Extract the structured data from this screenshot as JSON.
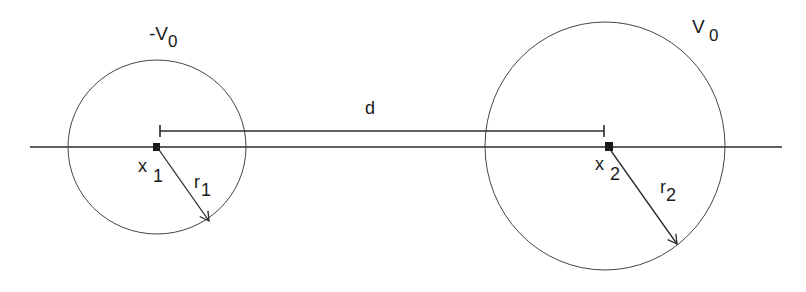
{
  "diagram": {
    "type": "two-charged-spheres",
    "colors": {
      "stroke": "#2a2a2a",
      "background": "#ffffff",
      "text": "#1a1a1a"
    },
    "sphere_left": {
      "potential_label": {
        "main": "-V",
        "sub": "0"
      },
      "center_label": {
        "main": "x",
        "sub": "1"
      },
      "radius_label": {
        "main": "r",
        "sub": "1"
      }
    },
    "sphere_right": {
      "potential_label": {
        "main": "V",
        "sub": "0"
      },
      "center_label": {
        "main": "x",
        "sub": "2"
      },
      "radius_label": {
        "main": "r",
        "sub": "2"
      }
    },
    "distance_label": "d"
  }
}
